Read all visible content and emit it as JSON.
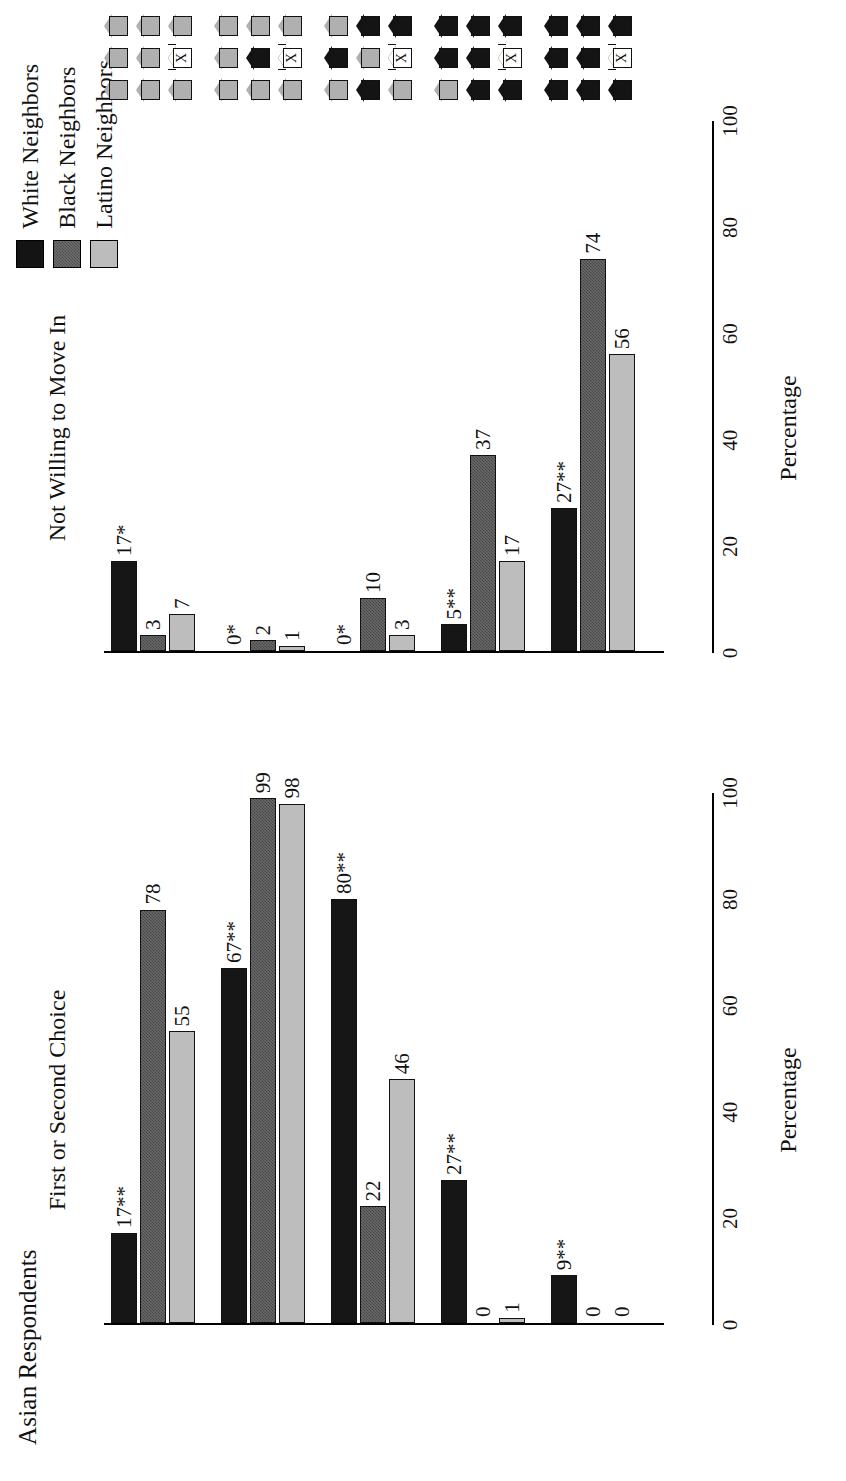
{
  "figure": {
    "title": "Asian Respondents",
    "axis_label": "Percentage"
  },
  "legend": {
    "items": [
      {
        "label": "White Neighbors",
        "key": "white",
        "color": "#161616"
      },
      {
        "label": "Black Neighbors",
        "key": "black",
        "color": "#6a6a6a"
      },
      {
        "label": "Latino Neighbors",
        "key": "latino",
        "color": "#bdbdbd"
      }
    ]
  },
  "panels": [
    {
      "id": "left",
      "heading": "First or Second Choice"
    },
    {
      "id": "right",
      "heading": "Not Willing to Move In"
    }
  ],
  "ticks": [
    "0",
    "20",
    "40",
    "60",
    "80",
    "100"
  ],
  "pictograms": {
    "legend_note": "3x3 neighborhood grids; center house marked X is the respondent",
    "scenarios": [
      {
        "index": 1,
        "filled": 0,
        "cells": [
          "gray",
          "gray",
          "gray",
          "gray",
          "gray",
          "gray",
          "gray",
          "you",
          "gray"
        ]
      },
      {
        "index": 2,
        "filled": 1,
        "cells": [
          "gray",
          "gray",
          "gray",
          "gray",
          "filled",
          "gray",
          "gray",
          "you",
          "gray"
        ]
      },
      {
        "index": 3,
        "filled": 3,
        "cells": [
          "gray",
          "filled",
          "gray",
          "filled",
          "gray",
          "filled",
          "gray",
          "you",
          "filled"
        ]
      },
      {
        "index": 4,
        "filled": 5,
        "cells": [
          "gray",
          "filled",
          "filled",
          "filled",
          "filled",
          "filled",
          "filled",
          "you",
          "filled"
        ]
      },
      {
        "index": 5,
        "filled": 8,
        "cells": [
          "filled",
          "filled",
          "filled",
          "filled",
          "filled",
          "filled",
          "filled",
          "you",
          "filled"
        ]
      }
    ]
  },
  "chart_data": [
    {
      "type": "bar",
      "title": "First or Second Choice",
      "panel": "left",
      "xlabel": "Percentage",
      "ylabel": "",
      "xlim": [
        0,
        100
      ],
      "ticks": [
        0,
        20,
        40,
        60,
        80,
        100
      ],
      "orientation": "horizontal",
      "grid": false,
      "legend_position": "top-right",
      "categories": [
        "Scenario 1",
        "Scenario 2",
        "Scenario 3",
        "Scenario 4",
        "Scenario 5"
      ],
      "series": [
        {
          "name": "White Neighbors",
          "values": [
            17,
            67,
            80,
            27,
            9
          ],
          "labels": [
            "17**",
            "67**",
            "80**",
            "27**",
            "9**"
          ]
        },
        {
          "name": "Black Neighbors",
          "values": [
            78,
            99,
            22,
            0,
            0
          ],
          "labels": [
            "78",
            "99",
            "22",
            "0",
            "0"
          ]
        },
        {
          "name": "Latino Neighbors",
          "values": [
            55,
            98,
            46,
            1,
            0
          ],
          "labels": [
            "55",
            "98",
            "46",
            "1",
            "0"
          ]
        }
      ]
    },
    {
      "type": "bar",
      "title": "Not Willing to Move In",
      "panel": "right",
      "xlabel": "Percentage",
      "ylabel": "",
      "xlim": [
        0,
        100
      ],
      "ticks": [
        0,
        20,
        40,
        60,
        80,
        100
      ],
      "orientation": "horizontal",
      "grid": false,
      "legend_position": "top-right",
      "categories": [
        "Scenario 1",
        "Scenario 2",
        "Scenario 3",
        "Scenario 4",
        "Scenario 5"
      ],
      "series": [
        {
          "name": "White Neighbors",
          "values": [
            17,
            0,
            0,
            5,
            27
          ],
          "labels": [
            "17*",
            "0*",
            "0*",
            "5**",
            "27**"
          ]
        },
        {
          "name": "Black Neighbors",
          "values": [
            3,
            2,
            10,
            37,
            74
          ],
          "labels": [
            "3",
            "2",
            "10",
            "37",
            "74"
          ]
        },
        {
          "name": "Latino Neighbors",
          "values": [
            7,
            1,
            3,
            17,
            56
          ],
          "labels": [
            "7",
            "1",
            "3",
            "17",
            "56"
          ]
        }
      ]
    }
  ]
}
